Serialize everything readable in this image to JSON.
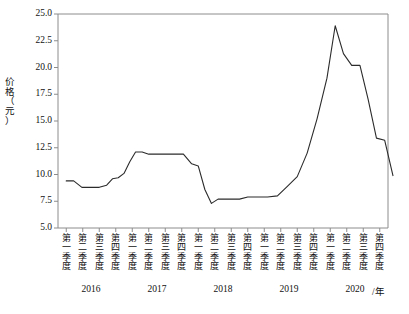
{
  "chart_data": {
    "type": "line",
    "title": "",
    "xlabel": "/年",
    "ylabel": "价格（元）",
    "ylim": [
      5.0,
      25.0
    ],
    "grid": false,
    "legend": null,
    "ytick_labels": [
      "25.0",
      "22.5",
      "20.0",
      "17.5",
      "15.0",
      "12.5",
      "10.0",
      "7.5",
      "5.0"
    ],
    "ytick_values": [
      25.0,
      22.5,
      20.0,
      17.5,
      15.0,
      12.5,
      10.0,
      7.5,
      5.0
    ],
    "quarter_labels": [
      "第一季度",
      "第二季度",
      "第三季度",
      "第四季度"
    ],
    "year_labels": [
      "2016",
      "2017",
      "2018",
      "2019",
      "2020"
    ],
    "categories": [
      "2016第一季度",
      "2016第二季度",
      "2016第三季度",
      "2016第四季度",
      "2017第一季度",
      "2017第二季度",
      "2017第三季度",
      "2017第四季度",
      "2018第一季度",
      "2018第二季度",
      "2018第三季度",
      "2018第四季度",
      "2019第一季度",
      "2019第二季度",
      "2019第三季度",
      "2019第四季度",
      "2020第一季度",
      "2020第二季度",
      "2020第三季度",
      "2020第四季度"
    ],
    "values": [
      9.4,
      9.4,
      8.8,
      8.8,
      8.8,
      9.7,
      10.1,
      12.1,
      12.0,
      11.9,
      11.9,
      11.9,
      11.9,
      10.8,
      7.3,
      7.7,
      7.7,
      7.9,
      7.9,
      7.9
    ],
    "x_fine": [
      0.0,
      0.45,
      0.95,
      1.5,
      2.0,
      2.45,
      2.8,
      3.15,
      3.5,
      3.85,
      4.2,
      4.6,
      5.0,
      5.5,
      6.3,
      7.1,
      7.6,
      8.0,
      8.4,
      8.8,
      9.2,
      9.6,
      10.0,
      10.5,
      11.0,
      11.6,
      12.2,
      12.8,
      13.4,
      14.0,
      14.6,
      15.2,
      15.8,
      16.3,
      16.8,
      17.3,
      17.8,
      18.3,
      18.8,
      19.3,
      19.8
    ],
    "y_fine": [
      9.4,
      9.4,
      8.8,
      8.8,
      8.8,
      9.0,
      9.6,
      9.7,
      10.1,
      11.2,
      12.1,
      12.1,
      11.9,
      11.9,
      11.9,
      11.9,
      11.0,
      10.8,
      8.6,
      7.3,
      7.7,
      7.7,
      7.7,
      7.7,
      7.9,
      7.9,
      7.9,
      8.0,
      8.9,
      9.8,
      12.0,
      15.2,
      19.0,
      23.9,
      21.3,
      20.2,
      20.2,
      17.0,
      13.4,
      13.2,
      9.9
    ],
    "series_name": "价格",
    "line_color": "#2b2b2b",
    "axis_color": "#8c8c8c"
  }
}
